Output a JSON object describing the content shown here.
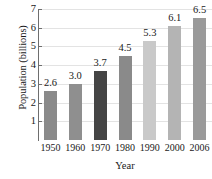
{
  "chart_data": {
    "type": "bar",
    "title": "",
    "xlabel": "Year",
    "ylabel": "Population (billions)",
    "categories": [
      "1950",
      "1960",
      "1970",
      "1980",
      "1990",
      "2000",
      "2006"
    ],
    "values": [
      2.6,
      3.0,
      3.7,
      4.5,
      5.3,
      6.1,
      6.5
    ],
    "value_labels": [
      "2.6",
      "3.0",
      "3.7",
      "4.5",
      "5.3",
      "6.1",
      "6.5"
    ],
    "ylim": [
      0,
      7
    ],
    "yticks": [
      1,
      2,
      3,
      4,
      5,
      6,
      7
    ],
    "ytick_labels": [
      "1",
      "2",
      "3",
      "4",
      "5",
      "6",
      "7"
    ],
    "grid": true,
    "legend": "none",
    "bar_colors": [
      "#8a8a8a",
      "#8f8f8f",
      "#454545",
      "#8a8a8a",
      "#c9c9c9",
      "#b4b4b4",
      "#9a9a9a"
    ],
    "axis_color": "#6e6e6e",
    "gridline_color": "#e3e3e3",
    "text_color": "#1a1a1a",
    "background": "#ffffff"
  }
}
